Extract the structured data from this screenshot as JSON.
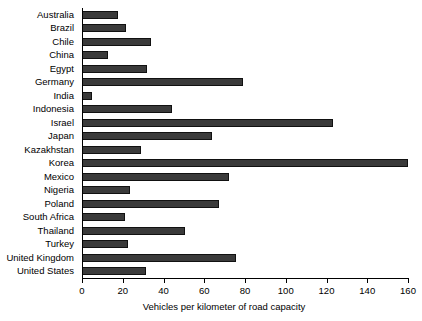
{
  "chart_data": {
    "type": "bar",
    "orientation": "horizontal",
    "title": "",
    "xlabel": "Vehicles per kilometer of road capacity",
    "ylabel": "",
    "xlim": [
      0,
      160
    ],
    "xticks": [
      0,
      20,
      40,
      60,
      80,
      100,
      120,
      140,
      160
    ],
    "xtick_labels": [
      "0",
      "20",
      "40",
      "60",
      "80",
      "100",
      "120",
      "140",
      "160"
    ],
    "grid": false,
    "legend": false,
    "bar_color": "#3a3a3a",
    "bar_edge_color": "#111111",
    "background_color": "#ffffff",
    "axis_color": "#000000",
    "categories": [
      "Australia",
      "Brazil",
      "Chile",
      "China",
      "Egypt",
      "Germany",
      "India",
      "Indonesia",
      "Israel",
      "Japan",
      "Kazakhstan",
      "Korea",
      "Mexico",
      "Nigeria",
      "Poland",
      "South Africa",
      "Thailand",
      "Turkey",
      "United Kingdom",
      "United States"
    ],
    "values": [
      17.5,
      21.5,
      34,
      13,
      32,
      79,
      5,
      44,
      123,
      64,
      29,
      160,
      72,
      23.5,
      67,
      21,
      50.5,
      22.5,
      75.5,
      31.5
    ]
  }
}
